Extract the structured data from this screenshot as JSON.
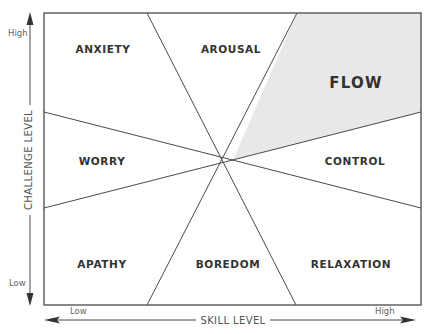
{
  "diagram": {
    "y_axis": {
      "label": "CHALLENGE LEVEL",
      "high": "High",
      "low": "Low"
    },
    "x_axis": {
      "label": "SKILL LEVEL",
      "low": "Low",
      "high": "High"
    },
    "regions": [
      {
        "id": "anxiety",
        "label": "ANXIETY",
        "highlighted": false
      },
      {
        "id": "arousal",
        "label": "AROUSAL",
        "highlighted": false
      },
      {
        "id": "flow",
        "label": "FLOW",
        "highlighted": true
      },
      {
        "id": "worry",
        "label": "WORRY",
        "highlighted": false
      },
      {
        "id": "control",
        "label": "CONTROL",
        "highlighted": false
      },
      {
        "id": "apathy",
        "label": "APATHY",
        "highlighted": false
      },
      {
        "id": "boredom",
        "label": "BOREDOM",
        "highlighted": false
      },
      {
        "id": "relaxation",
        "label": "RELAXATION",
        "highlighted": false
      }
    ],
    "colors": {
      "line": "#4a4a4a",
      "flow_fill": "#e8e8e8",
      "text": "#333333",
      "background": "#ffffff"
    }
  }
}
